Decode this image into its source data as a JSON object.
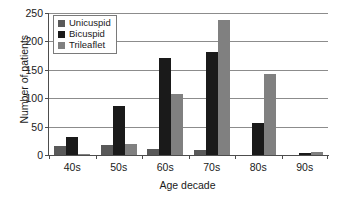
{
  "chart_data": {
    "type": "bar",
    "title": "",
    "xlabel": "Age decade",
    "ylabel": "Number of patients",
    "categories": [
      "40s",
      "50s",
      "60s",
      "70s",
      "80s",
      "90s"
    ],
    "series": [
      {
        "name": "Unicuspid",
        "color": "#595959",
        "values": [
          15,
          18,
          11,
          9,
          0,
          0
        ]
      },
      {
        "name": "Bicuspid",
        "color": "#1a1a1a",
        "values": [
          32,
          86,
          170,
          181,
          56,
          3
        ]
      },
      {
        "name": "Trileaflet",
        "color": "#808080",
        "values": [
          2,
          19,
          108,
          237,
          143,
          6
        ]
      }
    ],
    "ylim": [
      0,
      250
    ],
    "yticks": [
      0,
      50,
      100,
      150,
      200,
      250
    ],
    "ytick_labels": [
      "0",
      "50",
      "100",
      "150",
      "200",
      "250"
    ],
    "grid": "horizontal",
    "legend_position": "top-left"
  },
  "legend": {
    "items": [
      {
        "label": "Unicuspid"
      },
      {
        "label": "Bicuspid"
      },
      {
        "label": "Trileaflet"
      }
    ]
  }
}
